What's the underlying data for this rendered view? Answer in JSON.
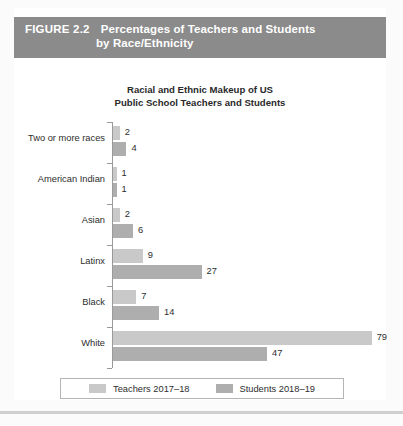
{
  "figure": {
    "label": "FIGURE 2.2",
    "title_line1": "Percentages of Teachers and Students",
    "title_line2": "by Race/Ethnicity",
    "banner_color": "#8b8b8b",
    "banner_text_color": "#ffffff"
  },
  "chart_title_line1": "Racial and Ethnic Makeup of US",
  "chart_title_line2": "Public School Teachers and Students",
  "legend": {
    "items": [
      {
        "label": "Teachers 2017–18",
        "color": "#c9c9c9"
      },
      {
        "label": "Students 2018–19",
        "color": "#aeaeae"
      }
    ]
  },
  "chart_data": {
    "type": "bar",
    "orientation": "horizontal",
    "title": "Racial and Ethnic Makeup of US Public School Teachers and Students",
    "xlabel": "",
    "ylabel": "",
    "xlim": [
      0,
      80
    ],
    "grid": false,
    "legend_position": "bottom",
    "categories": [
      "Two or more races",
      "American Indian",
      "Asian",
      "Latinx",
      "Black",
      "White"
    ],
    "series": [
      {
        "name": "Teachers 2017–18",
        "color": "#c9c9c9",
        "values": [
          2,
          1,
          2,
          9,
          7,
          79
        ]
      },
      {
        "name": "Students 2018–19",
        "color": "#aeaeae",
        "values": [
          4,
          1,
          6,
          27,
          14,
          47
        ]
      }
    ],
    "data_labels": {
      "Two or more races": {
        "teachers": "2",
        "students": "4"
      },
      "American Indian": {
        "teachers": "1",
        "students": "1"
      },
      "Asian": {
        "teachers": "2",
        "students": "6"
      },
      "Latinx": {
        "teachers": "9",
        "students": "27"
      },
      "Black": {
        "teachers": "7",
        "students": "14"
      },
      "White": {
        "teachers": "79",
        "students": "47"
      }
    }
  }
}
